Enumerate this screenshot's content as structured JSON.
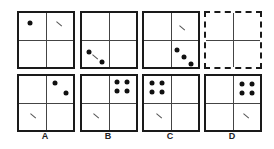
{
  "puzzle": {
    "question_row": [
      {
        "id": "q1",
        "style": "solid",
        "dots": [
          [
            11,
            10
          ]
        ],
        "dashes": [
          [
            40,
            11
          ]
        ]
      },
      {
        "id": "q2",
        "style": "solid",
        "dots": [
          [
            7,
            39
          ],
          [
            20,
            49
          ]
        ],
        "dashes": [
          [
            13,
            44
          ]
        ]
      },
      {
        "id": "q3",
        "style": "solid",
        "dots": [
          [
            33,
            37
          ],
          [
            40,
            44
          ],
          [
            47,
            51
          ]
        ],
        "dashes": [
          [
            38,
            15
          ]
        ]
      },
      {
        "id": "q4",
        "style": "dashed",
        "dots": [],
        "dashes": []
      }
    ],
    "options": [
      {
        "label": "A",
        "dots": [
          [
            36,
            7
          ],
          [
            47,
            17
          ]
        ],
        "dashes": [
          [
            14,
            40
          ]
        ]
      },
      {
        "label": "B",
        "dots": [
          [
            35,
            6
          ],
          [
            45,
            6
          ],
          [
            35,
            15
          ],
          [
            45,
            15
          ]
        ],
        "dashes": [
          [
            14,
            40
          ]
        ]
      },
      {
        "label": "C",
        "dots": [
          [
            8,
            7
          ],
          [
            18,
            7
          ],
          [
            8,
            16
          ],
          [
            18,
            16
          ]
        ],
        "dashes": [
          [
            15,
            40
          ]
        ]
      },
      {
        "label": "D",
        "dots": [
          [
            36,
            8
          ],
          [
            46,
            8
          ],
          [
            36,
            17
          ],
          [
            46,
            17
          ]
        ],
        "dashes": [
          [
            40,
            40
          ]
        ]
      }
    ]
  }
}
